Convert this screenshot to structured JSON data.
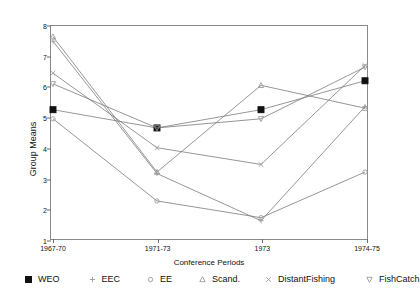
{
  "chart_data": {
    "type": "line",
    "title": "",
    "xlabel": "Conference Periods",
    "ylabel": "Group Means",
    "categories": [
      "1967-70",
      "1971-73",
      "1973",
      "1974-75"
    ],
    "ylim": [
      1,
      8
    ],
    "yticks": [
      "1",
      "2",
      "3",
      "4",
      "5",
      "6",
      "7",
      "8"
    ],
    "grid": false,
    "legend_position": "bottom",
    "series": [
      {
        "name": "WEO",
        "marker": "filled-square",
        "values": [
          5.25,
          4.65,
          5.25,
          6.2
        ]
      },
      {
        "name": "EEC",
        "marker": "plus",
        "values": [
          7.5,
          3.15,
          1.6,
          5.35
        ]
      },
      {
        "name": "EE",
        "marker": "open-circle",
        "values": [
          4.95,
          2.25,
          1.7,
          3.2
        ]
      },
      {
        "name": "Scand.",
        "marker": "open-triangle-up",
        "values": [
          7.65,
          3.2,
          6.05,
          5.3
        ]
      },
      {
        "name": "DistantFishing",
        "marker": "cross-x",
        "values": [
          6.45,
          4.0,
          3.45,
          6.7
        ]
      },
      {
        "name": "FishCatch",
        "marker": "open-triangle-down",
        "values": [
          6.1,
          4.65,
          4.95,
          6.65
        ]
      }
    ]
  },
  "colors": {
    "line": "#7a7a7a",
    "axis": "#8a8a8a",
    "marker_fill": "#111111",
    "marker_open": "#9a9a9a",
    "text": "#111111"
  }
}
